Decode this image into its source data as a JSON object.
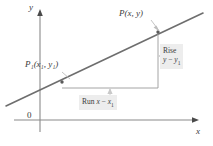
{
  "figure": {
    "type": "coordinate-geometry-diagram",
    "axes": {
      "y_label": "y",
      "x_label": "x",
      "origin_label": "0"
    },
    "points": [
      {
        "id": "P",
        "label": "P(x, y)",
        "label_main": "P(",
        "var1": "x",
        "sep": ", ",
        "var2": "y",
        "close": ")"
      },
      {
        "id": "P1",
        "label": "P₁(x₁, y₁)"
      }
    ],
    "callouts": {
      "rise": {
        "line1": "Rise",
        "line2_left": "y",
        "line2_minus": " − ",
        "line2_right": "y",
        "line2_sub": "1"
      },
      "run": {
        "word": "Run ",
        "var_left": "x",
        "minus": " − ",
        "var_right": "x",
        "sub": "1"
      }
    },
    "colors": {
      "background": "#ffffff",
      "line": "#6b6b6b",
      "axis": "#8a8a8a",
      "text": "#3b3b3b",
      "callout_bg": "#ededed",
      "leader": "#c9c9c9"
    },
    "geometry": {
      "y_axis_x": 40,
      "x_axis_y": 120,
      "line_start": [
        6,
        106
      ],
      "line_end": [
        203,
        13
      ],
      "p1_point": [
        62,
        82
      ],
      "p_point": [
        158,
        32
      ],
      "corner_point": [
        158,
        88
      ]
    }
  }
}
